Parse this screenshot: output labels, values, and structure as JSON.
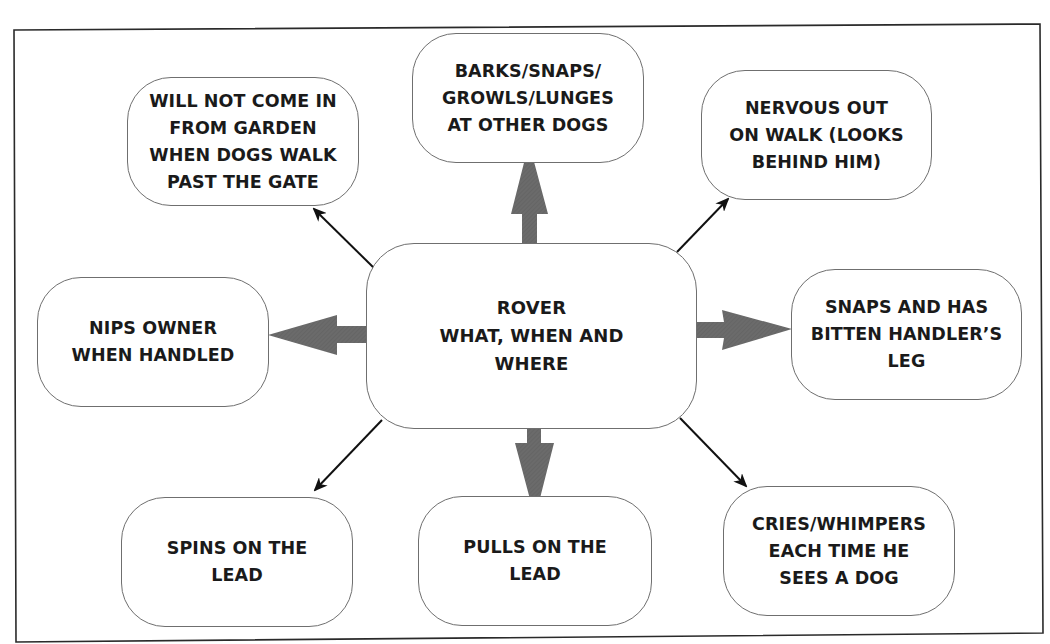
{
  "diagram": {
    "type": "mind-map",
    "center": {
      "label": "ROVER\nWHAT, WHEN AND\nWHERE"
    },
    "nodes": [
      {
        "id": "top-left",
        "label": "WILL NOT COME IN\nFROM GARDEN\nWHEN DOGS WALK\nPAST THE GATE",
        "connector": "thin-arrow"
      },
      {
        "id": "top",
        "label": "BARKS/SNAPS/\nGROWLS/LUNGES\nAT OTHER DOGS",
        "connector": "thick-arrow"
      },
      {
        "id": "top-right",
        "label": "NERVOUS OUT\nON WALK (LOOKS\nBEHIND HIM)",
        "connector": "thin-arrow"
      },
      {
        "id": "left",
        "label": "NIPS OWNER\nWHEN HANDLED",
        "connector": "thick-arrow"
      },
      {
        "id": "right",
        "label": "SNAPS AND HAS\nBITTEN HANDLER’S\nLEG",
        "connector": "thick-arrow"
      },
      {
        "id": "bottom-left",
        "label": "SPINS ON THE\nLEAD",
        "connector": "thin-arrow"
      },
      {
        "id": "bottom",
        "label": "PULLS ON THE\nLEAD",
        "connector": "thick-arrow"
      },
      {
        "id": "bottom-right",
        "label": "CRIES/WHIMPERS\nEACH TIME HE\nSEES A DOG",
        "connector": "thin-arrow"
      }
    ],
    "colors": {
      "thick_arrow": "#6b6b6b",
      "thin_arrow": "#111111",
      "node_border": "#6f6f6f",
      "frame": "#2a2a2a",
      "text": "#1a1a1a"
    }
  }
}
